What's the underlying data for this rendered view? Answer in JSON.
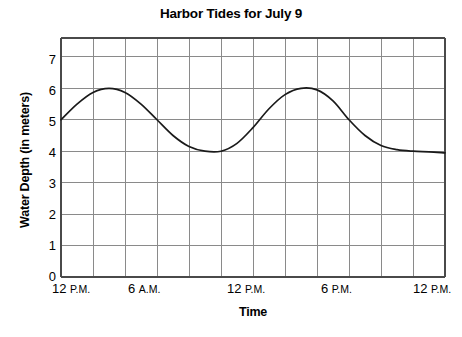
{
  "chart_data": {
    "type": "line",
    "title": "Harbor Tides for July 9",
    "xlabel": "Time",
    "ylabel": "Water Depth (in meters)",
    "ylim": [
      0,
      7.6
    ],
    "xlim": [
      0,
      24
    ],
    "grid": true,
    "legend": "none",
    "y_ticks": [
      7,
      6,
      5,
      4,
      3,
      2,
      1,
      0
    ],
    "y_tick_labels": [
      "7",
      "6",
      "5",
      "4",
      "3",
      "2",
      "1",
      "0"
    ],
    "x_tick_labels": [
      {
        "num": "12",
        "mer": "P.M."
      },
      {
        "num": "6",
        "mer": "A.M."
      },
      {
        "num": "12",
        "mer": "P.M."
      },
      {
        "num": "6",
        "mer": "P.M."
      },
      {
        "num": "12",
        "mer": "P.M."
      }
    ],
    "x_tick_hours": [
      0,
      6,
      12,
      18,
      24
    ],
    "x_minor_gridline_hours": [
      2,
      4,
      6,
      8,
      10,
      12,
      14,
      16,
      18,
      20,
      22
    ],
    "x": [
      0,
      1,
      2,
      3,
      4,
      5,
      6,
      7,
      8,
      9,
      10,
      11,
      12,
      13,
      14,
      15,
      16,
      17,
      18,
      19,
      20,
      21,
      22,
      23,
      24
    ],
    "values": [
      5.0,
      5.5,
      5.87,
      6.0,
      5.87,
      5.5,
      5.0,
      4.5,
      4.15,
      4.0,
      4.0,
      4.25,
      4.75,
      5.35,
      5.8,
      6.0,
      5.95,
      5.6,
      5.0,
      4.5,
      4.18,
      4.05,
      4.0,
      3.98,
      3.95
    ],
    "series_name": "Water depth",
    "line_color": "#1a1a1a",
    "grid_color": "#8a8a8a",
    "axis_color": "#4a4a4a",
    "peaks": [
      {
        "hour": 3,
        "depth": 6
      },
      {
        "hour": 15,
        "depth": 6
      }
    ],
    "troughs": [
      {
        "hour": 9.5,
        "depth": 4
      },
      {
        "hour": 23,
        "depth": 4
      }
    ],
    "start_value": 5,
    "end_value": 4
  }
}
